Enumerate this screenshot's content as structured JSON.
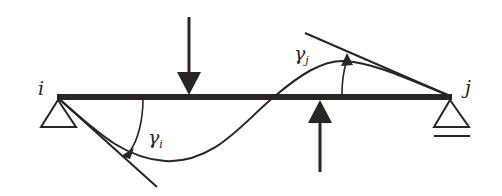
{
  "diagram": {
    "colors": {
      "ink": "#2a2422",
      "background": "#ffffff"
    },
    "nodes": {
      "left": {
        "label": "i",
        "support": "pin"
      },
      "right": {
        "label": "j",
        "support": "roller"
      }
    },
    "loads": [
      {
        "name": "downward-load",
        "direction": "down"
      },
      {
        "name": "upward-load",
        "direction": "up"
      }
    ],
    "angles": {
      "left": {
        "symbol": "γ",
        "subscript": "i"
      },
      "right": {
        "symbol": "γ",
        "subscript": "j"
      }
    }
  }
}
